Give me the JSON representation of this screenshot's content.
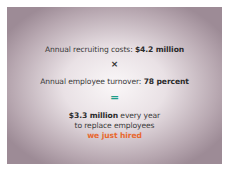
{
  "slide": {
    "line1": {
      "label": "Annual recruiting costs: ",
      "value": "$4.2 million"
    },
    "operator1": "×",
    "line2": {
      "label": "Annual employee turnover: ",
      "value": "78 percent"
    },
    "operator2": "=",
    "result": {
      "value": "$3.3 million",
      "suffix": " every year",
      "line2": "to replace employees",
      "line3": "we just hired"
    },
    "colors": {
      "equals": "#1f9e8a",
      "highlight": "#e8682f",
      "background_edge": "#9d8b96"
    }
  }
}
